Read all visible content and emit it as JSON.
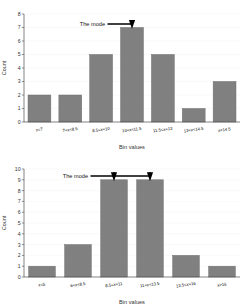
{
  "figures": [
    {
      "id": "unimodal-histogram",
      "annotation": "The mode",
      "xlabel": "Bin values",
      "ylabel": "Count",
      "yticks": [
        "0",
        "1",
        "2",
        "3",
        "4",
        "5",
        "6",
        "7",
        "8"
      ],
      "xticks": [
        "x<7",
        "7<x<8.5",
        "8.5<x<10",
        "10<x<11.5",
        "11.5<x<13",
        "13<x<14.5",
        "x>14.5"
      ]
    },
    {
      "id": "bimodal-histogram",
      "annotation": "The mode",
      "xlabel": "Bin values",
      "ylabel": "Count",
      "yticks": [
        "0",
        "1",
        "2",
        "3",
        "4",
        "5",
        "6",
        "7",
        "8",
        "9",
        "10"
      ],
      "xticks": [
        "x<6",
        "6<x<8.5",
        "8.5<x<11",
        "11<x<13.5",
        "13.5<x<16",
        "x>16"
      ]
    }
  ],
  "chart_data": [
    {
      "type": "bar",
      "title": "",
      "xlabel": "Bin values",
      "ylabel": "Count",
      "ylim": [
        0,
        8
      ],
      "grid": true,
      "categories": [
        "x<7",
        "7<x<8.5",
        "8.5<x<10",
        "10<x<11.5",
        "11.5<x<13",
        "13<x<14.5",
        "x>14.5"
      ],
      "values": [
        2,
        2,
        5,
        7,
        5,
        1,
        3
      ],
      "annotations": [
        {
          "text": "The mode",
          "points_to_category": "10<x<11.5",
          "points_to_value": 7
        }
      ],
      "legend": null
    },
    {
      "type": "bar",
      "title": "",
      "xlabel": "Bin values",
      "ylabel": "Count",
      "ylim": [
        0,
        10
      ],
      "grid": true,
      "categories": [
        "x<6",
        "6<x<8.5",
        "8.5<x<11",
        "11<x<13.5",
        "13.5<x<16",
        "x>16"
      ],
      "values": [
        1,
        3,
        9,
        9,
        2,
        1
      ],
      "annotations": [
        {
          "text": "The mode",
          "points_to_category": "8.5<x<11",
          "points_to_value": 9
        },
        {
          "text": "The mode",
          "points_to_category": "11<x<13.5",
          "points_to_value": 9
        }
      ],
      "legend": null
    }
  ],
  "colors": {
    "bar_fill": "#808080",
    "bar_edge": "#6d6d6d",
    "axis": "#4d4d4d",
    "grid": "#f2f2f2",
    "annotation": "#000000",
    "background": "#ffffff"
  }
}
